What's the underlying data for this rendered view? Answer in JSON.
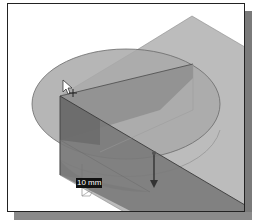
{
  "viewport": {
    "background": "#ffffff",
    "border_color": "#222222"
  },
  "model": {
    "plane_color": "#b9b9b9",
    "disc_color": "#a8a8a8",
    "box_top_color": "#8d8d8d",
    "box_front_color": "#6f6f6f",
    "box_side_color": "#7d7d7d"
  },
  "dimension": {
    "value_label": "10 mm"
  },
  "cursor": {
    "icon": "arrow-cursor-with-plus"
  },
  "manipulator": {
    "icon": "arrow-down-drag-handle"
  }
}
